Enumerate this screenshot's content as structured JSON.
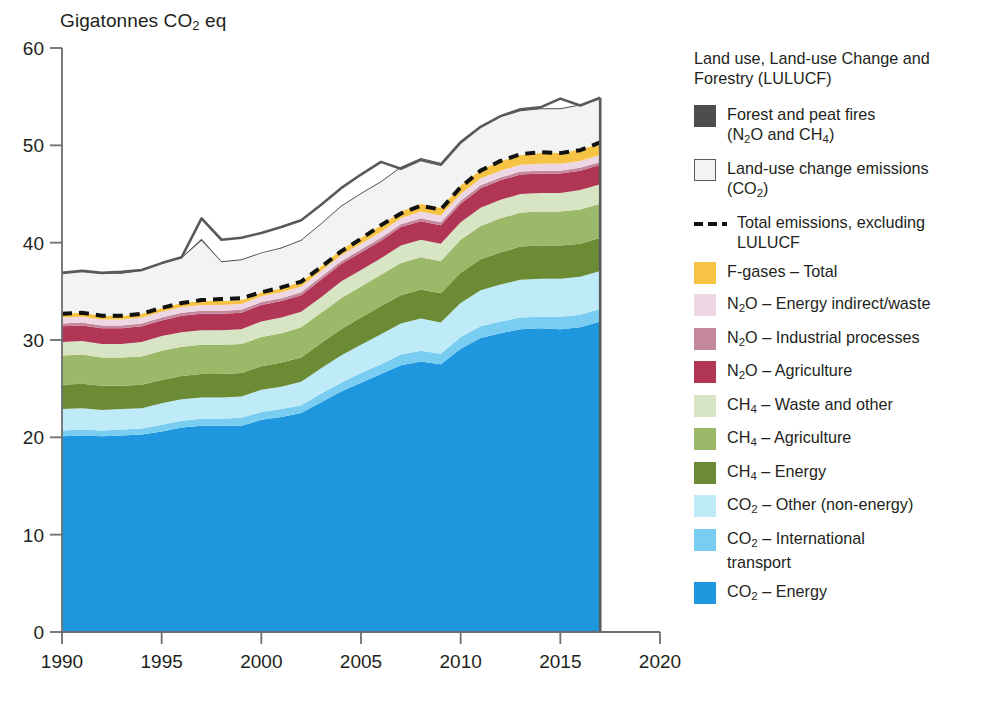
{
  "axis_title": "Gigatonnes CO2 eq",
  "axis": {
    "y_ticks": [
      0,
      10,
      20,
      30,
      40,
      50,
      60
    ],
    "x_ticks": [
      1990,
      1995,
      2000,
      2005,
      2010,
      2015,
      2020
    ]
  },
  "legend": {
    "heading": "Land use, Land-use Change and Forestry (LULUCF)",
    "items": [
      {
        "name": "forest-and-peat-fires",
        "label_html": "Forest and peat fires<br>(N<sub>2</sub>O and CH<sub>4</sub>)",
        "key": "swatch",
        "color": "#4d4d4d",
        "outlined": false
      },
      {
        "name": "land-use-change-emissions",
        "label_html": "Land-use change emissions<br>(CO<sub>2</sub>)",
        "key": "swatch",
        "color": "#f2f4f4",
        "outlined": true
      },
      {
        "name": "total-emissions-excluding-lulucf",
        "label_html": "Total emissions, excluding<br>LULUCF",
        "key": "dash",
        "color": "#111111",
        "outlined": false
      },
      {
        "name": "f-gases-total",
        "label_html": "F-gases &ndash; Total",
        "key": "swatch",
        "color": "#f6c344",
        "outlined": false
      },
      {
        "name": "n2o-energy-indirect-waste",
        "label_html": "N<sub>2</sub>O &ndash; Energy indirect/waste",
        "key": "swatch",
        "color": "#eed7e4",
        "outlined": false
      },
      {
        "name": "n2o-industrial-processes",
        "label_html": "N<sub>2</sub>O &ndash; Industrial processes",
        "key": "swatch",
        "color": "#c4889c",
        "outlined": false
      },
      {
        "name": "n2o-agriculture",
        "label_html": "N<sub>2</sub>O &ndash; Agriculture",
        "key": "swatch",
        "color": "#b13555",
        "outlined": false
      },
      {
        "name": "ch4-waste-and-other",
        "label_html": "CH<sub>4</sub> &ndash; Waste and other",
        "key": "swatch",
        "color": "#d8e5c4",
        "outlined": false
      },
      {
        "name": "ch4-agriculture",
        "label_html": "CH<sub>4</sub> &ndash; Agriculture",
        "key": "swatch",
        "color": "#9cb869",
        "outlined": false
      },
      {
        "name": "ch4-energy",
        "label_html": "CH<sub>4</sub> &ndash; Energy",
        "key": "swatch",
        "color": "#6b8b35",
        "outlined": false
      },
      {
        "name": "co2-other-non-energy",
        "label_html": "CO<sub>2</sub> &ndash; Other (non-energy)",
        "key": "swatch",
        "color": "#bfeaf8",
        "outlined": false
      },
      {
        "name": "co2-international-transport",
        "label_html": "CO<sub>2</sub> &ndash; International<br>transport",
        "key": "swatch",
        "color": "#79cdf0",
        "outlined": false
      },
      {
        "name": "co2-energy",
        "label_html": "CO<sub>2</sub> &ndash; Energy",
        "key": "swatch",
        "color": "#1f97df",
        "outlined": false
      }
    ]
  },
  "chart_data": {
    "type": "area",
    "title": "",
    "xlabel": "",
    "ylabel": "Gigatonnes CO2 eq",
    "xlim": [
      1990,
      2020
    ],
    "ylim": [
      0,
      60
    ],
    "grid": false,
    "legend_position": "right",
    "stacking": "stacked",
    "x": [
      1990,
      1991,
      1992,
      1993,
      1994,
      1995,
      1996,
      1997,
      1998,
      1999,
      2000,
      2001,
      2002,
      2003,
      2004,
      2005,
      2006,
      2007,
      2008,
      2009,
      2010,
      2011,
      2012,
      2013,
      2014,
      2015,
      2016,
      2017
    ],
    "series": [
      {
        "name": "CO2 - Energy",
        "color": "#1f97df",
        "values": [
          20.1,
          20.2,
          20.1,
          20.2,
          20.3,
          20.6,
          21.0,
          21.2,
          21.2,
          21.2,
          21.8,
          22.1,
          22.5,
          23.6,
          24.7,
          25.6,
          26.5,
          27.4,
          27.8,
          27.5,
          29.1,
          30.2,
          30.7,
          31.1,
          31.2,
          31.1,
          31.3,
          31.9
        ]
      },
      {
        "name": "CO2 - International transport",
        "color": "#79cdf0",
        "values": [
          0.6,
          0.6,
          0.6,
          0.6,
          0.6,
          0.7,
          0.7,
          0.7,
          0.7,
          0.8,
          0.8,
          0.8,
          0.8,
          0.9,
          0.9,
          1.0,
          1.0,
          1.1,
          1.1,
          1.1,
          1.2,
          1.2,
          1.2,
          1.2,
          1.2,
          1.3,
          1.3,
          1.3
        ]
      },
      {
        "name": "CO2 - Other (non-energy)",
        "color": "#bfeaf8",
        "values": [
          2.2,
          2.2,
          2.1,
          2.1,
          2.1,
          2.2,
          2.2,
          2.2,
          2.2,
          2.2,
          2.3,
          2.3,
          2.4,
          2.6,
          2.8,
          2.9,
          3.1,
          3.2,
          3.3,
          3.2,
          3.5,
          3.7,
          3.8,
          3.9,
          3.9,
          3.9,
          3.9,
          3.9
        ]
      },
      {
        "name": "CH4 - Energy",
        "color": "#6b8b35",
        "values": [
          2.5,
          2.5,
          2.5,
          2.4,
          2.4,
          2.4,
          2.4,
          2.4,
          2.4,
          2.4,
          2.4,
          2.5,
          2.5,
          2.6,
          2.7,
          2.8,
          2.9,
          2.9,
          3.0,
          3.0,
          3.1,
          3.2,
          3.3,
          3.4,
          3.4,
          3.4,
          3.4,
          3.4
        ]
      },
      {
        "name": "CH4 - Agriculture",
        "color": "#9cb869",
        "values": [
          3.0,
          3.0,
          2.9,
          2.9,
          2.9,
          3.0,
          3.0,
          3.0,
          3.0,
          3.0,
          3.0,
          3.0,
          3.1,
          3.1,
          3.2,
          3.2,
          3.2,
          3.3,
          3.3,
          3.3,
          3.4,
          3.4,
          3.5,
          3.5,
          3.5,
          3.5,
          3.5,
          3.5
        ]
      },
      {
        "name": "CH4 - Waste and other",
        "color": "#d8e5c4",
        "values": [
          1.4,
          1.4,
          1.4,
          1.4,
          1.5,
          1.5,
          1.5,
          1.5,
          1.5,
          1.5,
          1.6,
          1.6,
          1.6,
          1.6,
          1.7,
          1.7,
          1.7,
          1.8,
          1.8,
          1.8,
          1.8,
          1.9,
          1.9,
          1.9,
          1.9,
          1.9,
          2.0,
          2.0
        ]
      },
      {
        "name": "N2O - Agriculture",
        "color": "#b13555",
        "values": [
          1.6,
          1.6,
          1.6,
          1.6,
          1.6,
          1.6,
          1.7,
          1.7,
          1.7,
          1.7,
          1.7,
          1.7,
          1.7,
          1.8,
          1.8,
          1.8,
          1.8,
          1.9,
          1.9,
          1.9,
          1.9,
          2.0,
          2.0,
          2.0,
          2.0,
          2.0,
          2.0,
          2.0
        ]
      },
      {
        "name": "N2O - Industrial processes",
        "color": "#c4889c",
        "values": [
          0.3,
          0.3,
          0.3,
          0.3,
          0.3,
          0.3,
          0.3,
          0.3,
          0.3,
          0.3,
          0.3,
          0.3,
          0.3,
          0.3,
          0.3,
          0.3,
          0.3,
          0.3,
          0.3,
          0.3,
          0.3,
          0.3,
          0.3,
          0.3,
          0.3,
          0.3,
          0.3,
          0.3
        ]
      },
      {
        "name": "N2O - Energy indirect/waste",
        "color": "#eed7e4",
        "values": [
          0.6,
          0.6,
          0.6,
          0.6,
          0.6,
          0.6,
          0.6,
          0.6,
          0.6,
          0.6,
          0.6,
          0.6,
          0.6,
          0.6,
          0.6,
          0.6,
          0.6,
          0.6,
          0.7,
          0.7,
          0.7,
          0.7,
          0.7,
          0.7,
          0.7,
          0.7,
          0.7,
          0.7
        ]
      },
      {
        "name": "F-gases - Total",
        "color": "#f6c344",
        "values": [
          0.4,
          0.4,
          0.4,
          0.4,
          0.4,
          0.4,
          0.4,
          0.4,
          0.4,
          0.4,
          0.4,
          0.4,
          0.5,
          0.5,
          0.6,
          0.6,
          0.7,
          0.7,
          0.8,
          0.8,
          0.9,
          0.9,
          1.0,
          1.0,
          1.1,
          1.1,
          1.2,
          1.2
        ]
      },
      {
        "name": "Land-use change emissions (CO2)",
        "color": "#f2f4f4",
        "values": [
          4.1,
          4.2,
          4.3,
          4.3,
          4.4,
          4.5,
          4.6,
          6.2,
          4.0,
          4.1,
          4.0,
          4.1,
          4.2,
          4.3,
          4.4,
          4.5,
          4.4,
          4.5,
          4.6,
          4.5,
          4.5,
          4.4,
          4.5,
          4.5,
          4.5,
          4.5,
          4.5,
          4.5
        ]
      },
      {
        "name": "Forest and peat fires (N2O and CH4)",
        "color": "#4d4d4d",
        "values": [
          0.1,
          0.1,
          0.1,
          0.1,
          0.1,
          0.1,
          0.1,
          0.2,
          0.1,
          0.1,
          0.1,
          0.1,
          0.1,
          0.1,
          0.1,
          0.1,
          0.1,
          0.1,
          0.1,
          0.1,
          0.1,
          0.1,
          0.1,
          0.1,
          0.1,
          0.1,
          0.1,
          0.1
        ]
      }
    ],
    "annotation_lines": [
      {
        "name": "total-emissions-excluding-lulucf",
        "style": "dashed",
        "color": "#111111",
        "values": [
          32.7,
          32.8,
          32.5,
          32.5,
          32.7,
          33.3,
          33.8,
          34.1,
          34.2,
          34.3,
          34.9,
          35.4,
          36.0,
          37.5,
          39.1,
          40.4,
          41.8,
          43.0,
          43.8,
          43.4,
          45.7,
          47.4,
          48.4,
          49.1,
          49.3,
          49.2,
          49.5,
          50.3
        ]
      },
      {
        "name": "total-emissions-including-lulucf",
        "style": "solid",
        "color": "#58595b",
        "values": [
          36.9,
          37.1,
          36.9,
          37.0,
          37.2,
          37.9,
          38.5,
          42.5,
          40.3,
          40.5,
          41.0,
          41.6,
          42.3,
          43.9,
          45.6,
          47.0,
          48.3,
          47.6,
          48.5,
          48.0,
          50.3,
          51.9,
          53.0,
          53.7,
          53.9,
          54.8,
          54.1,
          54.9
        ]
      }
    ]
  }
}
